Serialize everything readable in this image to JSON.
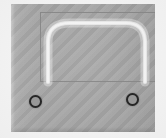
{
  "image": {
    "title": "Gray faceplate with arch marking",
    "width": 166,
    "height": 138,
    "caption": ""
  },
  "colors": {
    "background": "#f7f7f7",
    "panel": "#a8a8a8",
    "inset_outline": "#8a8a8a",
    "arch_stroke": "#e9e9e9",
    "screw_outline": "#252525",
    "screw_fill": "#9a9a9a"
  },
  "panel": {
    "name": "faceplate",
    "x": 11,
    "y": 4,
    "width": 144,
    "height": 128,
    "texture": "diagonal-stripe"
  },
  "inset_rectangle": {
    "name": "recessed-window",
    "x": 40,
    "y": 12,
    "width": 117,
    "height": 70,
    "stroke_width": 1
  },
  "arch": {
    "name": "arch-curve",
    "description": "rounded-top arch / inverted-U stroke",
    "apex_y": 21,
    "left_leg_x": 48,
    "right_leg_x": 137,
    "bottom_y": 80,
    "stroke_width": 4.2,
    "path": "M 8 70 L 8 30 Q 8 11 30 11 L 86 11 Q 104 11 105 29 L 105 70"
  },
  "screws": [
    {
      "name": "screw-hole-left",
      "cx": 35,
      "cy": 101,
      "diameter": 13
    },
    {
      "name": "screw-hole-right",
      "cx": 132,
      "cy": 99,
      "diameter": 13
    }
  ],
  "labels": {
    "alt_text": ""
  }
}
